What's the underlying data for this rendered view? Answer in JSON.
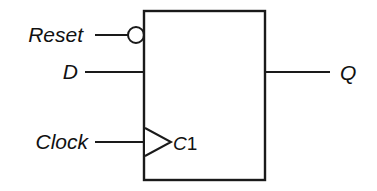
{
  "diagram": {
    "type": "logic-symbol",
    "colors": {
      "background": "#ffffff",
      "stroke": "#1a1a1a",
      "text": "#111111"
    },
    "body": {
      "shape": "rectangle",
      "x": 144,
      "y": 11,
      "width": 121,
      "height": 169
    },
    "inputs": [
      {
        "id": "reset",
        "external_label": "Reset",
        "pin_number": "1",
        "pin_letter": "R",
        "pin_label": "1R",
        "inverted": true,
        "bubble": {
          "cx": 136,
          "cy": 35,
          "r": 8
        },
        "wire": {
          "x1": 95,
          "x2": 128,
          "y": 35
        },
        "label_pos": {
          "x": 83,
          "y": 42,
          "anchor": "end"
        },
        "pin_pos": {
          "x": 155,
          "y": 42
        }
      },
      {
        "id": "data",
        "external_label": "D",
        "pin_number": "1",
        "pin_letter": "D",
        "pin_label": "1D",
        "inverted": false,
        "wire": {
          "x1": 85,
          "x2": 144,
          "y": 72
        },
        "label_pos": {
          "x": 78,
          "y": 79,
          "anchor": "end"
        },
        "pin_pos": {
          "x": 155,
          "y": 79
        }
      },
      {
        "id": "clock",
        "external_label": "Clock",
        "pin_number": "1",
        "pin_letter": "C",
        "pin_label": "C1",
        "inverted": false,
        "edge_triggered": true,
        "triangle": {
          "x1": 145,
          "y1": 128,
          "x2": 171,
          "y2": 142,
          "x3": 145,
          "y3": 156
        },
        "wire": {
          "x1": 95,
          "x2": 144,
          "y": 142
        },
        "label_pos": {
          "x": 88,
          "y": 149,
          "anchor": "end"
        },
        "pin_pos": {
          "x": 173,
          "y": 150
        }
      }
    ],
    "outputs": [
      {
        "id": "q",
        "external_label": "Q",
        "inverted": false,
        "wire": {
          "x1": 265,
          "x2": 330,
          "y": 72
        },
        "label_pos": {
          "x": 340,
          "y": 80,
          "anchor": "start"
        }
      }
    ]
  }
}
